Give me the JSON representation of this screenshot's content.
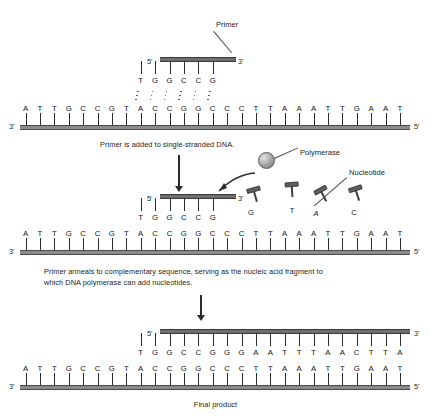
{
  "figure": {
    "final_caption": "Final product"
  },
  "colors": {
    "backbone_light": "#8c8c8c",
    "backbone_dark": "#6e6e6e",
    "tick": "#2b2b2b",
    "text": "#1c1c1c",
    "nucleotide": "#5e5e5e"
  },
  "panels": [
    {
      "id": "panel-1",
      "caption": "Primer is added to single-stranded DNA.",
      "callouts": [
        {
          "name": "primer",
          "label": "Primer"
        }
      ],
      "primer": {
        "five_prime": "5'",
        "three_prime": "3'",
        "bases": [
          "T",
          "G",
          "G",
          "C",
          "C",
          "G"
        ]
      },
      "template": {
        "five_prime": "5'",
        "three_prime": "3'",
        "bases": [
          "A",
          "T",
          "T",
          "G",
          "C",
          "C",
          "G",
          "T",
          "A",
          "C",
          "C",
          "G",
          "G",
          "C",
          "C",
          "C",
          "T",
          "T",
          "A",
          "A",
          "A",
          "T",
          "T",
          "G",
          "A",
          "A",
          "T"
        ]
      }
    },
    {
      "id": "panel-2",
      "caption": "Primer anneals to complementary sequence, serving as the nucleic acid fragment to\nwhich DNA polymerase can add nucleotides.",
      "callouts": [
        {
          "name": "polymerase",
          "label": "Polymerase"
        },
        {
          "name": "nucleotide",
          "label": "Nucleotide"
        }
      ],
      "primer": {
        "five_prime": "5'",
        "three_prime": "3'",
        "bases": [
          "T",
          "G",
          "G",
          "C",
          "C",
          "G"
        ]
      },
      "template": {
        "five_prime": "5'",
        "three_prime": "3'",
        "bases": [
          "A",
          "T",
          "T",
          "G",
          "C",
          "C",
          "G",
          "T",
          "A",
          "C",
          "C",
          "G",
          "G",
          "C",
          "C",
          "C",
          "T",
          "T",
          "A",
          "A",
          "A",
          "T",
          "T",
          "G",
          "A",
          "A",
          "T"
        ]
      },
      "free_nucleotides": [
        {
          "label": "G"
        },
        {
          "label": "T"
        },
        {
          "label": "A"
        },
        {
          "label": "C"
        }
      ]
    },
    {
      "id": "panel-3",
      "caption": "Final product",
      "new_strand": {
        "five_prime": "5'",
        "three_prime": "3'",
        "bases": [
          "T",
          "G",
          "G",
          "C",
          "C",
          "G",
          "G",
          "G",
          "A",
          "A",
          "T",
          "T",
          "T",
          "A",
          "A",
          "C",
          "T",
          "T",
          "A"
        ]
      },
      "template": {
        "five_prime": "5'",
        "three_prime": "3'",
        "bases": [
          "A",
          "T",
          "T",
          "G",
          "C",
          "C",
          "G",
          "T",
          "A",
          "C",
          "C",
          "G",
          "G",
          "C",
          "C",
          "C",
          "T",
          "T",
          "A",
          "A",
          "A",
          "T",
          "T",
          "G",
          "A",
          "A",
          "T"
        ]
      }
    }
  ]
}
